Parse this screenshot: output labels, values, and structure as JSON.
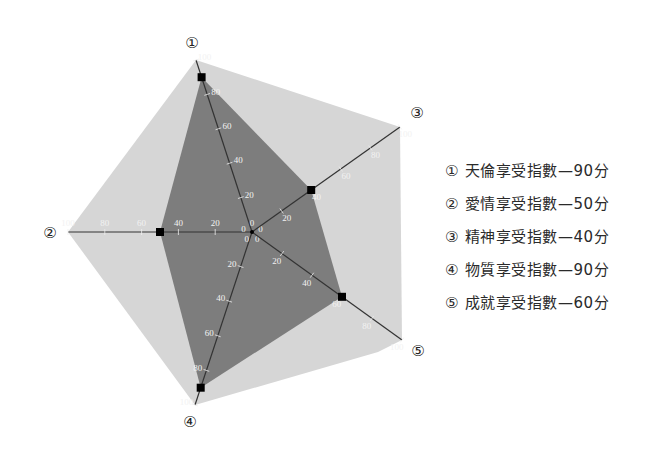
{
  "chart_data": {
    "type": "radar",
    "title": "",
    "axes": [
      {
        "id": "1",
        "marker": "①",
        "label": "天倫享受指數"
      },
      {
        "id": "2",
        "marker": "②",
        "label": "愛情享受指數"
      },
      {
        "id": "3",
        "marker": "③",
        "label": "精神享受指數"
      },
      {
        "id": "4",
        "marker": "④",
        "label": "物質享受指數"
      },
      {
        "id": "5",
        "marker": "⑤",
        "label": "成就享受指數"
      }
    ],
    "series": [
      {
        "name": "享受指數",
        "values": [
          90,
          50,
          40,
          90,
          60
        ]
      }
    ],
    "range": [
      0,
      100
    ],
    "ticks": [
      0,
      20,
      40,
      60,
      80,
      100
    ],
    "grid": false,
    "legend_position": "right",
    "colors": {
      "outer_fill": "#d6d6d6",
      "inner_fill": "#7d7d7d",
      "axis": "#333333",
      "marker": "#000000"
    }
  },
  "legend": [
    {
      "marker": "①",
      "text": "天倫享受指數—90分"
    },
    {
      "marker": "②",
      "text": "愛情享受指數—50分"
    },
    {
      "marker": "③",
      "text": "精神享受指數—40分"
    },
    {
      "marker": "④",
      "text": "物質享受指數—90分"
    },
    {
      "marker": "⑤",
      "text": "成就享受指數—60分"
    }
  ]
}
